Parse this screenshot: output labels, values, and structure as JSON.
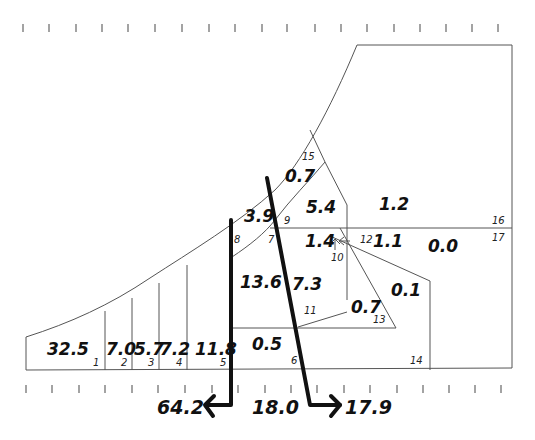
{
  "diagram": {
    "regions": [
      {
        "id": "1",
        "value": "32.5"
      },
      {
        "id": "2",
        "value": "7.0"
      },
      {
        "id": "3",
        "value": "5.7"
      },
      {
        "id": "4",
        "value": "7.2"
      },
      {
        "id": "5",
        "value": "11.8"
      },
      {
        "id": "6",
        "value": "0.5"
      },
      {
        "id": "7",
        "value": "13.6"
      },
      {
        "id": "8",
        "value": "3.9"
      },
      {
        "id": "9",
        "value": "5.4"
      },
      {
        "id": "10",
        "value": "1.4"
      },
      {
        "id": "11",
        "value": "7.3"
      },
      {
        "id": "12",
        "value": "1.1"
      },
      {
        "id": "13",
        "value": "0.7"
      },
      {
        "id": "14",
        "value": "0.1"
      },
      {
        "id": "15",
        "value": "0.7"
      },
      {
        "id": "16",
        "value": "1.2"
      },
      {
        "id": "17",
        "value": "0.0"
      }
    ],
    "labels": {
      "v_32_5": "32.5",
      "n1": "1",
      "v_7_0": "7.0",
      "n2": "2",
      "v_5_7": "5.7",
      "n3": "3",
      "v_7_2": "7.2",
      "n4": "4",
      "v_11_8": "11.8",
      "n5": "5",
      "v_0_5": "0.5",
      "n6": "6",
      "v_13_6": "13.6",
      "n7": "7",
      "v_3_9": "3.9",
      "n8": "8",
      "v_5_4": "5.4",
      "n9": "9",
      "v_1_4": "1.4",
      "n10": "10",
      "v_7_3": "7.3",
      "n11": "11",
      "v_1_1": "1.1",
      "n12": "12",
      "v_0_7b": "0.7",
      "n13": "13",
      "v_0_1": "0.1",
      "n14": "14",
      "v_0_7a": "0.7",
      "n15": "15",
      "v_1_2": "1.2",
      "n16": "16",
      "v_0_0": "0.0",
      "n17": "17"
    },
    "totals": {
      "left": "64.2",
      "middle": "18.0",
      "right": "17.9"
    },
    "tick_count_top": 19,
    "tick_count_bottom": 19
  }
}
